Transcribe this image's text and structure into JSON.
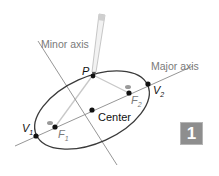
{
  "diagram": {
    "labels": {
      "minor_axis": "Minor axis",
      "major_axis": "Major axis",
      "center": "Center",
      "point_p": "P",
      "vertex1": "V",
      "vertex1_sub": "1",
      "vertex2": "V",
      "vertex2_sub": "2",
      "focus1": "F",
      "focus1_sub": "1",
      "focus2": "F",
      "focus2_sub": "2"
    },
    "badge": "1",
    "colors": {
      "ellipse": "#3a3a3a",
      "axis": "#8a8a8a",
      "label": "#7a7a7a",
      "badge": "#8e8e8e",
      "string": "#c8c8c8"
    }
  }
}
